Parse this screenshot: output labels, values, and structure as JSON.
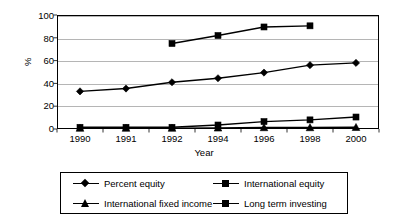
{
  "chart_data": {
    "type": "line",
    "title": "",
    "xlabel": "Year",
    "ylabel": "%",
    "categories": [
      "1990",
      "1991",
      "1992",
      "1994",
      "1996",
      "1998",
      "2000"
    ],
    "ylim": [
      0,
      100
    ],
    "yticks": [
      "0",
      "20",
      "40",
      "60",
      "80",
      "100"
    ],
    "grid": true,
    "legend_position": "bottom",
    "series": [
      {
        "name": "Percent equity",
        "marker": "diamond",
        "values": [
          33,
          35.5,
          41,
          44.5,
          49.5,
          56,
          58
        ]
      },
      {
        "name": "International equity",
        "marker": "square",
        "values": [
          1.5,
          1.5,
          1.5,
          3.5,
          6.5,
          8,
          10.5
        ]
      },
      {
        "name": "International fixed income",
        "marker": "triangle",
        "values": [
          0.8,
          0.8,
          0.8,
          1,
          1.3,
          1.3,
          1.5
        ]
      },
      {
        "name": "Long term investing",
        "marker": "square",
        "values": [
          null,
          null,
          75,
          82,
          89.5,
          90.5,
          null
        ]
      }
    ]
  },
  "legend": {
    "entries": [
      {
        "label": "Percent equity",
        "marker": "diamond-marker-icon"
      },
      {
        "label": "International equity",
        "marker": "square-marker-icon"
      },
      {
        "label": "International fixed income",
        "marker": "triangle-marker-icon"
      },
      {
        "label": "Long term investing",
        "marker": "square-marker-icon"
      }
    ]
  },
  "colors": {
    "line": "#000000",
    "grid": "#b5b5b5",
    "axis": "#000000",
    "background": "#ffffff"
  }
}
